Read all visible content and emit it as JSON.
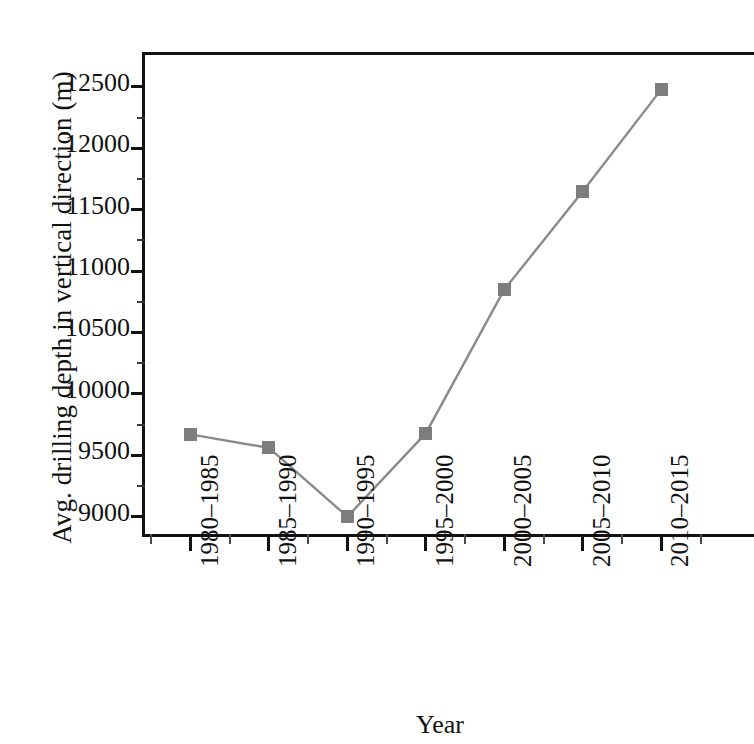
{
  "chart_data": {
    "type": "line",
    "title": "",
    "xlabel": "Year",
    "ylabel": "Avg. drilling depth in vertical direction (m)",
    "categories": [
      "1980–1985",
      "1985–1990",
      "1990–1995",
      "1995–2000",
      "2000–2005",
      "2005–2010",
      "2010–2015"
    ],
    "values": [
      9670,
      9560,
      9000,
      9680,
      10850,
      11650,
      12480
    ],
    "series": [
      {
        "name": "Avg. drilling depth in vertical direction (m)",
        "values": [
          9670,
          9560,
          9000,
          9680,
          10850,
          11650,
          12480
        ]
      }
    ],
    "ylim": [
      8810,
      12760
    ],
    "ytick_labels": [
      "9000",
      "9500",
      "10000",
      "10500",
      "11000",
      "11500",
      "12000",
      "12500"
    ],
    "ytick_values": [
      9000,
      9500,
      10000,
      10500,
      11000,
      11500,
      12000,
      12500
    ],
    "yminor_values": [
      9250,
      9750,
      10250,
      10750,
      11250,
      11750,
      12250
    ],
    "grid": false,
    "legend": false,
    "marker": "square",
    "marker_color": "#7d7d7d",
    "line_color": "#8a8a8a",
    "axis_color": "#111111",
    "background_color": "#ffffff"
  },
  "axes": {
    "y_title": "Avg. drilling depth in vertical direction (m)",
    "x_title": "Year"
  }
}
